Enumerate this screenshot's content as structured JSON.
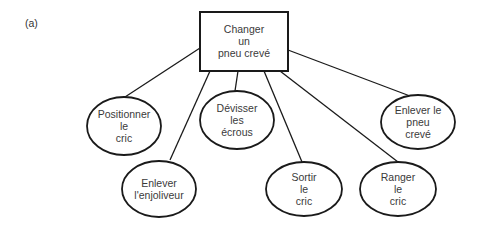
{
  "figure_label": "(a)",
  "colors": {
    "stroke": "#1a1a1a",
    "text": "#3a3a3a",
    "background": "#ffffff"
  },
  "root": {
    "lines": [
      "Changer",
      "un",
      "pneu crevé"
    ]
  },
  "children": [
    {
      "id": "positionner",
      "lines": [
        "Positionner",
        "le",
        "cric"
      ]
    },
    {
      "id": "enjoliveur",
      "lines": [
        "Enlever",
        "l'enjoliveur"
      ]
    },
    {
      "id": "devisser",
      "lines": [
        "Dévisser",
        "les",
        "écrous"
      ]
    },
    {
      "id": "sortir",
      "lines": [
        "Sortir",
        "le",
        "cric"
      ]
    },
    {
      "id": "ranger",
      "lines": [
        "Ranger",
        "le",
        "cric"
      ]
    },
    {
      "id": "enlever-pneu",
      "lines": [
        "Enlever le",
        "pneu",
        "crevé"
      ]
    }
  ]
}
